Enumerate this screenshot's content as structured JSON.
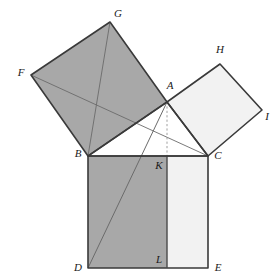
{
  "figure": {
    "background_color": "#ffffff",
    "canvas": {
      "width": 280,
      "height": 280
    },
    "stroke_color": "#3a3a3a",
    "thin_stroke_color": "#6b6b6b",
    "dashed_stroke_color": "#9a9a9a",
    "fill_dark": "#a8a8a8",
    "fill_light": "#f2f2f2",
    "fill_none": "#ffffff"
  },
  "points": {
    "A": {
      "x": 167,
      "y": 102,
      "label": "A",
      "label_x": 170,
      "label_y": 86
    },
    "B": {
      "x": 88,
      "y": 156,
      "label": "B",
      "label_x": 78,
      "label_y": 154
    },
    "C": {
      "x": 208,
      "y": 156,
      "label": "C",
      "label_x": 218,
      "label_y": 156
    },
    "D": {
      "x": 88,
      "y": 268,
      "label": "D",
      "label_x": 78,
      "label_y": 268
    },
    "E": {
      "x": 208,
      "y": 268,
      "label": "E",
      "label_x": 218,
      "label_y": 268
    },
    "F": {
      "x": 31,
      "y": 75,
      "label": "F",
      "label_x": 21,
      "label_y": 73
    },
    "G": {
      "x": 110,
      "y": 22,
      "label": "G",
      "label_x": 118,
      "label_y": 14
    },
    "H": {
      "x": 220,
      "y": 64,
      "label": "H",
      "label_x": 220,
      "label_y": 50
    },
    "I": {
      "x": 262,
      "y": 110,
      "label": "I",
      "label_x": 267,
      "label_y": 117
    },
    "K": {
      "x": 167,
      "y": 156,
      "label": "K",
      "label_x": 159,
      "label_y": 166
    },
    "L": {
      "x": 167,
      "y": 268,
      "label": "L",
      "label_x": 159,
      "label_y": 260
    }
  },
  "shapes": {
    "square_on_leg_ab": {
      "name": "BFGA",
      "polygon": "88,156 31,75 110,22 167,102",
      "fill": "#a8a8a8"
    },
    "square_on_leg_ac": {
      "name": "ACIH",
      "polygon": "167,102 208,156 262,110 220,64",
      "fill": "#f2f2f2"
    },
    "rect_bdlk": {
      "name": "BDLK",
      "polygon": "88,156 167,156 167,268 88,268",
      "fill": "#a8a8a8"
    },
    "rect_kleс": {
      "name": "KLEC",
      "polygon": "167,156 208,156 208,268 167,268",
      "fill": "#f2f2f2"
    },
    "triangle_abc": {
      "name": "ABC",
      "polygon": "88,156 167,102 208,156",
      "fill": "#ffffff"
    }
  },
  "construction_lines": {
    "fc": {
      "from": "F",
      "to": "C",
      "style": "thin"
    },
    "ad": {
      "from": "A",
      "to": "D",
      "style": "thin"
    },
    "bg": {
      "from": "B",
      "to": "G",
      "style": "thin"
    },
    "ak_dashed": {
      "from": "A",
      "to": "K",
      "style": "dashed"
    },
    "kl": {
      "from": "K",
      "to": "L",
      "style": "solid"
    }
  },
  "labels": [
    "A",
    "B",
    "C",
    "D",
    "E",
    "F",
    "G",
    "H",
    "I",
    "K",
    "L"
  ]
}
